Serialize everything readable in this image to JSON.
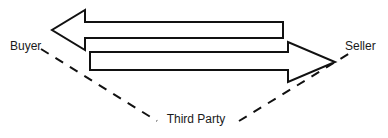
{
  "diagram": {
    "type": "flow-diagram",
    "width": 388,
    "height": 138,
    "background_color": "#ffffff",
    "stroke_color": "#111111",
    "text_color": "#1a1a1a",
    "labels": {
      "buyer": "Buyer",
      "seller": "Seller",
      "third_party": "Third Party"
    },
    "arrows": [
      {
        "name": "seller-to-buyer-arrow",
        "direction": "left",
        "from": "Seller",
        "to": "Buyer",
        "points": "283,22 85,22 85,10 52,30 85,50 85,38 283,38",
        "tip_x": 52,
        "tip_y": 30,
        "tail_x": 283
      },
      {
        "name": "buyer-to-seller-arrow",
        "direction": "right",
        "from": "Buyer",
        "to": "Seller",
        "points": "90,52 288,52 288,42 335,62 288,82 288,70 90,70",
        "tip_x": 335,
        "tip_y": 62,
        "tail_x": 90
      }
    ],
    "dashed_lines": [
      {
        "name": "buyer-to-third-party-line",
        "x1": 41,
        "y1": 49,
        "x2": 157,
        "y2": 121,
        "dash_pattern": "9 8"
      },
      {
        "name": "third-party-to-seller-line",
        "x1": 239,
        "y1": 121,
        "x2": 350,
        "y2": 53,
        "dash_pattern": "9 8"
      }
    ],
    "label_positions": {
      "buyer": {
        "x": 10,
        "y": 50,
        "anchor": "start"
      },
      "seller": {
        "x": 345,
        "y": 50,
        "anchor": "start"
      },
      "third_party": {
        "x": 196,
        "y": 123,
        "anchor": "middle"
      }
    }
  }
}
